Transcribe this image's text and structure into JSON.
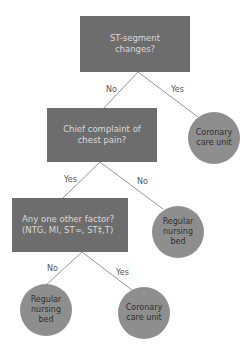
{
  "diagram": {
    "type": "decision-tree",
    "nodes": {
      "q1": {
        "lines": [
          "ST-segment",
          "changes?"
        ]
      },
      "q2": {
        "lines": [
          "Chief complaint of",
          "chest pain?"
        ]
      },
      "q3": {
        "lines": [
          "Any one other factor?",
          "(NTG, MI, ST∞, ST‡,T)"
        ]
      },
      "o1": {
        "lines": [
          "Coronary",
          "care unit"
        ]
      },
      "o2": {
        "lines": [
          "Regular",
          "nursing",
          "bed"
        ]
      },
      "o3": {
        "lines": [
          "Regular",
          "nursing",
          "bed"
        ]
      },
      "o4": {
        "lines": [
          "Coronary",
          "care unit"
        ]
      }
    },
    "edges": [
      {
        "from": "q1",
        "to": "q2",
        "label": "No"
      },
      {
        "from": "q1",
        "to": "o1",
        "label": "Yes"
      },
      {
        "from": "q2",
        "to": "q3",
        "label": "Yes"
      },
      {
        "from": "q2",
        "to": "o2",
        "label": "No"
      },
      {
        "from": "q3",
        "to": "o3",
        "label": "No"
      },
      {
        "from": "q3",
        "to": "o4",
        "label": "Yes"
      }
    ],
    "colors": {
      "question_fill": "#6d6d6d",
      "outcome_fill": "#8e8e8e",
      "connector": "#7a7a7a"
    }
  }
}
